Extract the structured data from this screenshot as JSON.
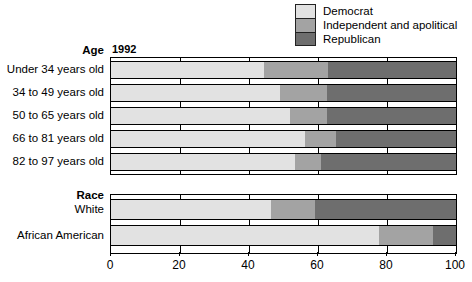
{
  "chart_data": {
    "type": "bar",
    "subtype": "stacked-horizontal-100",
    "title": "",
    "year_label": "1992",
    "xlabel": "",
    "ylabel": "",
    "xlim": [
      0,
      100
    ],
    "xticks": [
      0,
      20,
      40,
      60,
      80,
      100
    ],
    "xtick_labels": [
      "0",
      "20",
      "40",
      "60",
      "80",
      "100"
    ],
    "grid": true,
    "legend_position": "top-right",
    "legend": [
      {
        "name": "Democrat",
        "color": "#e2e2e2"
      },
      {
        "name": "Independent and apolitical",
        "color": "#a3a3a3"
      },
      {
        "name": "Republican",
        "color": "#6e6e6e"
      }
    ],
    "series": [
      {
        "name": "Democrat",
        "values": [
          44.3,
          48.9,
          52.0,
          56.2,
          53.3,
          46.4,
          77.6
        ]
      },
      {
        "name": "Independent and apolitical",
        "values": [
          18.6,
          13.7,
          10.6,
          8.9,
          7.5,
          12.8,
          15.8
        ]
      },
      {
        "name": "Republican",
        "values": [
          37.1,
          37.4,
          37.4,
          34.9,
          39.2,
          40.8,
          6.6
        ]
      }
    ],
    "groups": [
      {
        "header": "Age",
        "categories": [
          "Under 34 years old",
          "34 to 49 years old",
          "50 to 65 years old",
          "66 to 81 years old",
          "82 to 97 years old"
        ],
        "bars": [
          {
            "label": "Under 34 years old",
            "democrat": 44.3,
            "independent": 18.6,
            "republican": 37.1
          },
          {
            "label": "34 to 49 years old",
            "democrat": 48.9,
            "independent": 13.7,
            "republican": 37.4
          },
          {
            "label": "50 to 65 years old",
            "democrat": 52.0,
            "independent": 10.6,
            "republican": 37.4
          },
          {
            "label": "66 to 81 years old",
            "democrat": 56.2,
            "independent": 8.9,
            "republican": 34.9
          },
          {
            "label": "82 to 97 years old",
            "democrat": 53.3,
            "independent": 7.5,
            "republican": 39.2
          }
        ]
      },
      {
        "header": "Race",
        "categories": [
          "White",
          "African American"
        ],
        "bars": [
          {
            "label": "White",
            "democrat": 46.4,
            "independent": 12.8,
            "republican": 40.8
          },
          {
            "label": "African American",
            "democrat": 77.6,
            "independent": 15.8,
            "republican": 6.6
          }
        ]
      }
    ]
  }
}
